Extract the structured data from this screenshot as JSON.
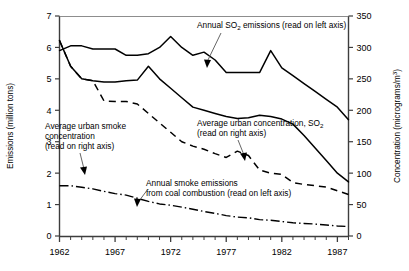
{
  "chart_data": {
    "type": "line",
    "title": "",
    "xlabel": "",
    "ylabel": "Emissions (million tons)",
    "y2label": "Concentration (micrograms/m3)",
    "xlim": [
      1962,
      1988
    ],
    "ylim": [
      0,
      7
    ],
    "y2lim": [
      0,
      350
    ],
    "grid": false,
    "legend": "annotations-inline",
    "x_ticks_major": [
      1962,
      1967,
      1972,
      1977,
      1982,
      1987
    ],
    "x_tick_labels": [
      "1962",
      "1967",
      "1972",
      "1977",
      "1982",
      "1987"
    ],
    "x_ticks_minor_step": 1,
    "y_ticks": [
      0,
      1,
      2,
      3,
      4,
      5,
      6,
      7
    ],
    "y_tick_labels": [
      "0",
      "1",
      "2",
      "3",
      "4",
      "5",
      "6",
      "7"
    ],
    "y2_ticks": [
      0,
      50,
      100,
      150,
      200,
      250,
      300,
      350
    ],
    "y2_tick_labels": [
      "0",
      "50",
      "100",
      "150",
      "200",
      "250",
      "300",
      "350"
    ],
    "x": [
      1962,
      1963,
      1964,
      1965,
      1966,
      1967,
      1968,
      1969,
      1970,
      1971,
      1972,
      1973,
      1974,
      1975,
      1976,
      1977,
      1978,
      1979,
      1980,
      1981,
      1982,
      1983,
      1984,
      1985,
      1986,
      1987,
      1988
    ],
    "series": [
      {
        "name": "Annual SO2 emissions (read on left axis)",
        "axis": "left",
        "style": "solid",
        "units": "million tons",
        "values": [
          5.9,
          6.05,
          6.05,
          5.95,
          5.95,
          5.95,
          5.75,
          5.75,
          5.8,
          6.0,
          6.35,
          6.0,
          5.75,
          5.85,
          5.6,
          5.2,
          5.2,
          5.2,
          5.2,
          5.9,
          5.35,
          5.1,
          4.85,
          4.6,
          4.35,
          4.1,
          3.7
        ]
      },
      {
        "name": "Average urban smoke concentration (read on right axis)",
        "axis": "right",
        "style": "dashed",
        "units": "micrograms/m3",
        "values": [
          311,
          270,
          250,
          247,
          215,
          214,
          214,
          210,
          195,
          180,
          165,
          150,
          143,
          138,
          131,
          125,
          135,
          128,
          105,
          100,
          98,
          85,
          82,
          80,
          78,
          72,
          66
        ]
      },
      {
        "name": "Average urban concentration, SO2 (read on right axis)",
        "axis": "right",
        "style": "solid",
        "units": "micrograms/m3",
        "values": [
          311,
          270,
          250,
          247,
          245,
          245,
          247,
          248,
          270,
          250,
          235,
          220,
          205,
          200,
          195,
          190,
          187,
          188,
          192,
          190,
          186,
          178,
          160,
          140,
          120,
          100,
          86
        ]
      },
      {
        "name": "Annual smoke emissions from coal combustion (read on left axis)",
        "axis": "left",
        "style": "dash-dot",
        "units": "million tons",
        "values": [
          1.6,
          1.6,
          1.55,
          1.5,
          1.42,
          1.35,
          1.3,
          1.2,
          1.1,
          1.02,
          0.98,
          0.92,
          0.85,
          0.78,
          0.72,
          0.65,
          0.6,
          0.58,
          0.52,
          0.5,
          0.46,
          0.42,
          0.4,
          0.38,
          0.35,
          0.32,
          0.3
        ]
      }
    ],
    "annotations": [
      {
        "id": "annot-so2-emissions",
        "text_lines": [
          "Annual SO2 emissions (read on left axis)"
        ],
        "target": "Annual SO2 emissions series"
      },
      {
        "id": "annot-urban-smoke",
        "text_lines": [
          "Average urban smoke",
          "concentration",
          "(read on right axis)"
        ],
        "target": "Average urban smoke concentration series"
      },
      {
        "id": "annot-urban-so2-conc",
        "text_lines": [
          "Average urban concentration, SO2",
          "(read on right axis)"
        ],
        "target": "Average urban concentration SO2 series"
      },
      {
        "id": "annot-smoke-emissions",
        "text_lines": [
          "Annual smoke emissions",
          "from coal combustion (read on left axis)"
        ],
        "target": "Annual smoke emissions from coal combustion series"
      }
    ]
  },
  "labels": {
    "y_axis_title": "Emissions (million tons)",
    "y2_axis_title_pre": "Concentration (micrograms/m",
    "y2_axis_title_sup": "3",
    "y2_axis_title_post": ")",
    "annot1_pre": "Annual SO",
    "annot1_sub": "2",
    "annot1_post": " emissions (read on left axis)",
    "annot2_line1": "Average urban smoke",
    "annot2_line2": "concentration",
    "annot2_line3": "(read on right axis)",
    "annot3_pre": "Average urban concentration, SO",
    "annot3_sub": "2",
    "annot3_line2": "(read on right axis)",
    "annot4_line1": "Annual smoke emissions",
    "annot4_line2": "from coal combustion (read on left axis)"
  },
  "ticks": {
    "y": [
      "7",
      "6",
      "5",
      "4",
      "3",
      "2",
      "1",
      "0"
    ],
    "y2": [
      "350",
      "300",
      "250",
      "200",
      "150",
      "100",
      "50",
      "0"
    ],
    "x": [
      "1962",
      "1967",
      "1972",
      "1977",
      "1982",
      "1987"
    ]
  },
  "colors": {
    "background": "#ffffff",
    "ink": "#000000",
    "axis": "#4a4a4a"
  }
}
